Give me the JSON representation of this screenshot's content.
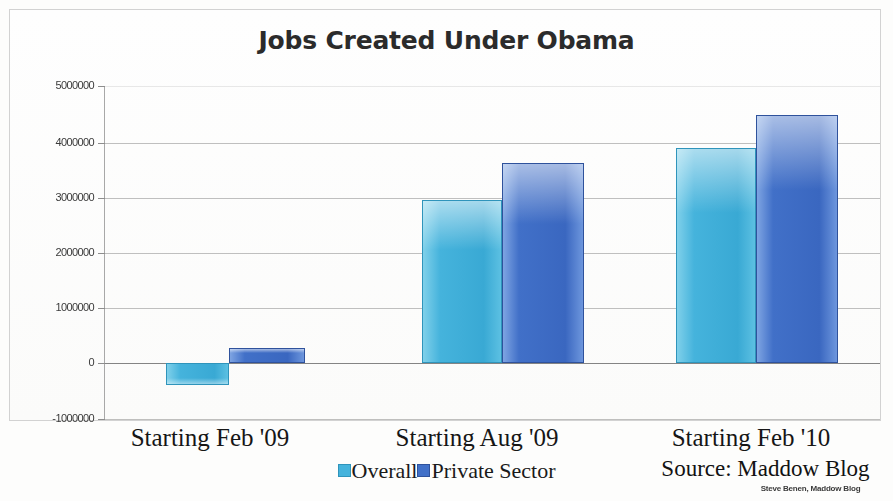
{
  "chart_data": {
    "type": "bar",
    "title": "Jobs Created Under Obama",
    "xlabel": "",
    "ylabel": "",
    "categories": [
      "Starting Feb '09",
      "Starting Aug '09",
      "Starting Feb '10"
    ],
    "series": [
      {
        "name": "Overall",
        "color": "#45b3dc",
        "values": [
          -400000,
          2930000,
          3870000
        ]
      },
      {
        "name": "Private Sector",
        "color": "#4170c8",
        "values": [
          270000,
          3600000,
          4470000
        ]
      }
    ],
    "ylim": [
      -1000000,
      5000000
    ],
    "yticks": [
      5000000,
      4000000,
      3000000,
      2000000,
      1000000,
      0,
      -1000000
    ],
    "ytick_labels": [
      "5000000",
      "4000000",
      "3000000",
      "2000000",
      "1000000",
      "0",
      "-1000000"
    ],
    "grid": true,
    "legend_position": "bottom",
    "annotations": [
      "Source: Maddow Blog",
      "Steve Benen, Maddow Blog"
    ]
  },
  "title": "Jobs Created Under Obama",
  "legend": {
    "overall_label": "Overall",
    "private_label": "Private Sector"
  },
  "source_note": "Source: Maddow Blog",
  "credit_note": "Steve Benen, Maddow Blog"
}
